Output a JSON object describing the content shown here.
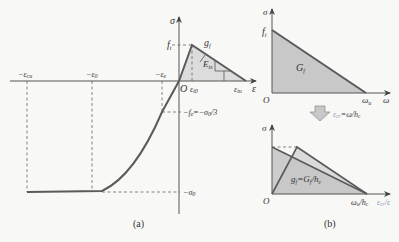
{
  "colors": {
    "background": "#f8f8f6",
    "curve": "#5a5a5a",
    "axis": "#555555",
    "fill_light": "#d9d9d9",
    "fill_dark": "#c4c4c4",
    "dashed": "#666666",
    "arrow_fill": "#c8c8c8",
    "label_blue": "#8a9ab8"
  },
  "panel_a": {
    "caption": "(a)",
    "axis_sigma": "σ",
    "axis_eps": "ε",
    "origin": "O",
    "labels": {
      "ft": "f",
      "ft_sub": "t",
      "gf": "g",
      "gf_sub": "f",
      "Ets": "E",
      "Ets_sub": "ts",
      "eps_t0": "ε",
      "eps_t0_sub": "t0",
      "eps_tu": "ε",
      "eps_tu_sub": "tu",
      "neg_eps_cu": "−ε",
      "neg_eps_cu_sub": "cu",
      "neg_eps_0": "−ε",
      "neg_eps_0_sub": "0",
      "neg_eps_e": "−ε",
      "neg_eps_e_sub": "e",
      "neg_fe": "−f",
      "neg_fe_sub": "e",
      "neg_fe_eq": "=−σ",
      "neg_fe_eq_sub": "0",
      "neg_fe_tail": "/3",
      "neg_sigma0": "−σ",
      "neg_sigma0_sub": "0"
    }
  },
  "panel_b": {
    "caption": "(b)",
    "top": {
      "axis_sigma": "σ",
      "axis_omega": "ω",
      "origin": "O",
      "ft": "f",
      "ft_sub": "t",
      "Gf": "G",
      "Gf_sub": "f",
      "omega_u": "ω",
      "omega_u_sub": "u"
    },
    "transform_label": {
      "lhs": "ε",
      "lhs_sub": "cr",
      "rhs": "=ω/h",
      "rhs_sub": "c"
    },
    "bottom": {
      "axis_sigma": "σ",
      "origin": "O",
      "gf_eq": "g",
      "gf_eq_sub": "f",
      "gf_eq_rhs": "=G",
      "gf_eq_rhs_sub": "f",
      "gf_eq_tail": "/h",
      "gf_eq_tail_sub": "c",
      "x_end": "ω",
      "x_end_sub": "u",
      "x_end_tail": "/h",
      "x_end_tail_sub": "c",
      "x_axis": "ε",
      "x_axis_sub": "cr",
      "x_axis_tail": "/ε"
    }
  }
}
